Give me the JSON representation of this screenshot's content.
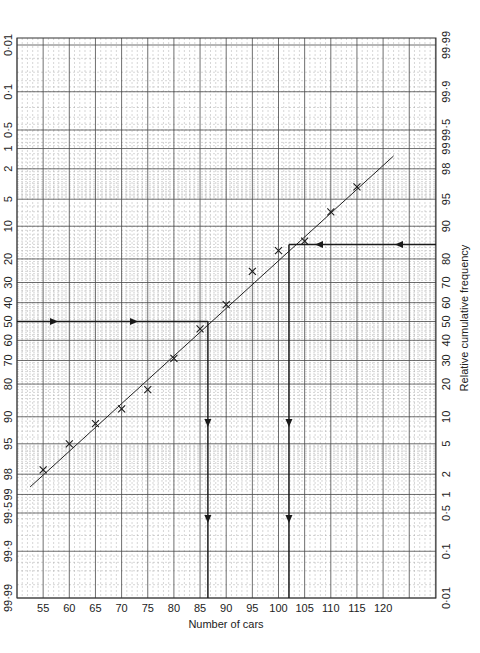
{
  "chart_data": {
    "type": "scatter",
    "subtype": "normal-probability-paper",
    "title": "",
    "xlabel": "Number of cars",
    "ylabel_right": "Relative cumulative frequency",
    "x_ticks": [
      55,
      60,
      65,
      70,
      75,
      80,
      85,
      90,
      95,
      100,
      105,
      110,
      115,
      120
    ],
    "xlim": [
      50,
      130
    ],
    "left_axis_ticks": [
      "0·01",
      "0·1",
      "0·5",
      "1",
      "2",
      "5",
      "10",
      "20",
      "30",
      "40",
      "50",
      "60",
      "70",
      "80",
      "90",
      "95",
      "98",
      "99",
      "99·5",
      "99·9",
      "99·99"
    ],
    "right_axis_ticks": [
      "99·99",
      "99·9",
      "99·5",
      "99",
      "98",
      "95",
      "90",
      "80",
      "70",
      "60",
      "50",
      "40",
      "30",
      "20",
      "10",
      "5",
      "2",
      "1",
      "0·5",
      "0·1",
      "0·01"
    ],
    "grid": true,
    "series": [
      {
        "name": "Observed relative cumulative frequency (%)",
        "marker": "x",
        "x": [
          55,
          60,
          65,
          70,
          75,
          80,
          85,
          90,
          95,
          100,
          105,
          110,
          115
        ],
        "y": [
          2.3,
          5,
          8.5,
          12,
          18,
          31,
          46,
          59,
          75,
          83,
          86,
          93,
          96.5
        ]
      },
      {
        "name": "Fitted straight line",
        "type": "line",
        "x": [
          52.5,
          122
        ],
        "y": [
          1.3,
          98.7
        ]
      }
    ],
    "annotations": [
      {
        "label": "50% reading",
        "from_y_percent": 50,
        "to_x": 86.5,
        "arrows": "right then down"
      },
      {
        "label": "85% reading",
        "from_y_percent": 85,
        "to_x": 102,
        "arrows": "left then down"
      }
    ]
  },
  "layout": {
    "grid_left": 17,
    "grid_right": 436,
    "grid_top": 38,
    "grid_bottom": 598,
    "x_px_per_unit": 5.23,
    "x_origin_value": 50,
    "colors": {
      "grid_major": "#4a4a4a",
      "grid_minor": "#9a9a9a",
      "ink": "#1a1a1a",
      "background": "#ffffff"
    }
  }
}
